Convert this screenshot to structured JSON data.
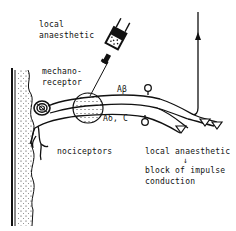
{
  "diagram": {
    "labels": {
      "local_anaesthetic_line1": "local",
      "local_anaesthetic_line2": "anaesthetic",
      "mechanoreceptor_line1": "mechano-",
      "mechanoreceptor_line2": "receptor",
      "fiber_a_beta": "Aβ",
      "fiber_a_delta_c": "Aδ, C",
      "nociceptors": "nociceptors",
      "caption_line1": "local anaesthetic",
      "caption_arrow": "↓",
      "caption_line2": "block of impulse",
      "caption_line3": "conduction"
    },
    "colors": {
      "ink": "#111111",
      "background": "#ffffff"
    }
  }
}
